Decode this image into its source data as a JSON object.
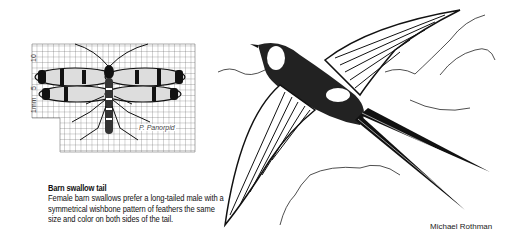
{
  "caption": {
    "title": "Barn swallow tail",
    "body": "Female barn swallows prefer a long-tailed male with a symmetrical wishbone pattern of feathers the same size and color on both sides of the tail."
  },
  "credit": "Michael Rothman",
  "insect_figure": {
    "scale_labels": [
      "10",
      "5",
      "1mm"
    ],
    "species_label": "P. Panorpid"
  },
  "illustrations": {
    "left": "scorpionfly-on-grid-icon",
    "right": "barn-swallow-in-flight-icon"
  },
  "colors": {
    "ink": "#111111",
    "grid": "#555555",
    "background": "#ffffff"
  }
}
